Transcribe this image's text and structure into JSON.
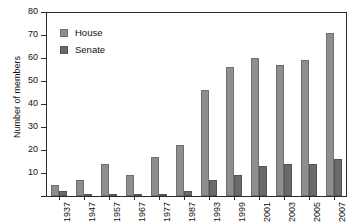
{
  "chart_data": {
    "type": "bar",
    "title": "",
    "xlabel": "",
    "ylabel": "Number of members",
    "ylim": [
      0,
      80
    ],
    "yticks": [
      0,
      10,
      20,
      30,
      40,
      50,
      60,
      70,
      80
    ],
    "ytick_labels": [
      "",
      "10",
      "20",
      "30",
      "40",
      "50",
      "60",
      "70",
      "80"
    ],
    "grid": false,
    "legend_position": "upper left",
    "categories": [
      "1937",
      "1947",
      "1957",
      "1967",
      "1977",
      "1987",
      "1993",
      "1999",
      "2001",
      "2003",
      "2005",
      "2007"
    ],
    "series": [
      {
        "name": "House",
        "color": "#8e8e8e",
        "values": [
          5,
          7,
          14,
          9,
          17,
          22,
          46,
          56,
          60,
          57,
          59,
          71
        ]
      },
      {
        "name": "Senate",
        "color": "#6a6a6a",
        "values": [
          2,
          1,
          1,
          1,
          1,
          2,
          7,
          9,
          13,
          14,
          14,
          16
        ]
      }
    ]
  },
  "axes": {
    "y_title": "Number of members"
  },
  "legend": {
    "items": [
      {
        "label": "House",
        "swatch": "house-swatch-icon"
      },
      {
        "label": "Senate",
        "swatch": "senate-swatch-icon"
      }
    ]
  },
  "colors": {
    "house": "#8e8e8e",
    "senate": "#6a6a6a",
    "axis": "#2b2b2b",
    "background": "#ffffff"
  }
}
